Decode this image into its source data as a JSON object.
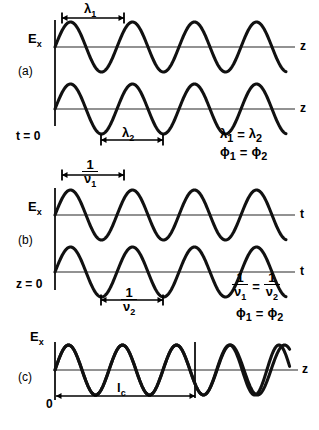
{
  "figure": {
    "background": "#ffffff",
    "ink": "#000000",
    "axis_color": "#6e6e6e",
    "wave_color": "#111111"
  },
  "panels": [
    {
      "id": "a",
      "label": "(a)",
      "label_pos": {
        "x": 18,
        "y": 71
      },
      "condition": "t = 0",
      "condition_pos": {
        "x": 16,
        "y": 136
      },
      "axis_variable": "z",
      "waves": [
        {
          "name": "wave-a1",
          "baseline_y": 47,
          "amplitude": 25,
          "wavelength_px": 62,
          "phase_deg": 0,
          "x_start": 55,
          "x_end": 286,
          "stroke": 3.1
        },
        {
          "name": "wave-a2",
          "baseline_y": 109,
          "amplitude": 25,
          "wavelength_px": 62,
          "phase_deg": 0,
          "x_start": 55,
          "x_end": 286,
          "stroke": 3.1
        }
      ],
      "axes": [
        {
          "name": "axis-a1",
          "y": 47,
          "x1": 55,
          "x2": 295,
          "end_label": "z",
          "end_label_pos": {
            "x": 300,
            "y": 42
          }
        },
        {
          "name": "axis-a2",
          "y": 109,
          "x1": 55,
          "x2": 295,
          "end_label": "z",
          "end_label_pos": {
            "x": 300,
            "y": 104
          }
        }
      ],
      "vertical_axis": {
        "x": 55,
        "y1": 20,
        "y2": 126
      },
      "y_labels": [
        {
          "text": "E",
          "sub": "x",
          "x": 28,
          "y": 38
        }
      ],
      "measures": [
        {
          "name": "lambda-1-measure",
          "symbol": "λ",
          "sub": "1",
          "x1": 62,
          "x2": 124,
          "y": 18,
          "label_x": 82,
          "label_y": 9,
          "ticks": true
        },
        {
          "name": "lambda-2-measure",
          "symbol": "λ",
          "sub": "2",
          "x1": 101,
          "x2": 163,
          "y": 140,
          "label_x": 120,
          "label_y": 131,
          "ticks": true
        }
      ],
      "annotations": [
        {
          "name": "annotation-lambda-equal",
          "text": "λ₁ = λ₂",
          "parts": [
            "λ",
            "1",
            " = ",
            "λ",
            "2"
          ],
          "x": 220,
          "y": 133
        },
        {
          "name": "annotation-phi-equal",
          "text": "φ₁ = φ₂",
          "parts": [
            "φ",
            "1",
            " = ",
            "φ",
            "2"
          ],
          "x": 220,
          "y": 151
        }
      ]
    },
    {
      "id": "b",
      "label": "(b)",
      "label_pos": {
        "x": 18,
        "y": 240
      },
      "condition": "z = 0",
      "condition_pos": {
        "x": 16,
        "y": 284
      },
      "axis_variable": "t",
      "waves": [
        {
          "name": "wave-b1",
          "baseline_y": 215,
          "amplitude": 25,
          "wavelength_px": 62,
          "phase_deg": 0,
          "x_start": 55,
          "x_end": 286,
          "stroke": 3.1
        },
        {
          "name": "wave-b2",
          "baseline_y": 272,
          "amplitude": 25,
          "wavelength_px": 62,
          "phase_deg": 0,
          "x_start": 55,
          "x_end": 286,
          "stroke": 3.1
        }
      ],
      "axes": [
        {
          "name": "axis-b1",
          "y": 215,
          "x1": 55,
          "x2": 295,
          "end_label": "t",
          "end_label_pos": {
            "x": 300,
            "y": 210
          }
        },
        {
          "name": "axis-b2",
          "y": 272,
          "x1": 55,
          "x2": 295,
          "end_label": "t",
          "end_label_pos": {
            "x": 300,
            "y": 267
          }
        }
      ],
      "vertical_axis": {
        "x": 55,
        "y1": 188,
        "y2": 290
      },
      "y_labels": [
        {
          "text": "E",
          "sub": "x",
          "x": 28,
          "y": 206
        }
      ],
      "measures": [
        {
          "name": "period-1-measure",
          "symbol": "1/ν",
          "sub": "1",
          "x1": 62,
          "x2": 124,
          "y": 175,
          "label_x": 83,
          "label_y": 162,
          "ticks": true
        },
        {
          "name": "period-2-measure",
          "symbol": "1/ν",
          "sub": "2",
          "x1": 101,
          "x2": 163,
          "y": 300,
          "label_x": 121,
          "label_y": 291,
          "ticks": true
        }
      ],
      "annotations": [
        {
          "name": "annotation-period-equal",
          "x": 232,
          "y": 277
        },
        {
          "name": "annotation-phi-equal-b",
          "text": "φ₁ = φ₂",
          "x": 236,
          "y": 311
        }
      ]
    },
    {
      "id": "c",
      "label": "(c)",
      "label_pos": {
        "x": 18,
        "y": 377
      },
      "condition": "",
      "axis_variable": "z",
      "waves": [
        {
          "name": "wave-c1",
          "baseline_y": 370,
          "amplitude": 25,
          "wavelength_px": 54,
          "phase_deg": 0,
          "x_start": 55,
          "x_end": 290,
          "stroke": 3.1
        },
        {
          "name": "wave-c2-dephasing",
          "baseline_y": 370,
          "amplitude": 25,
          "wavelength_px": 54,
          "phase_deg": 0,
          "x_start": 55,
          "x_end": 290,
          "stroke": 3.1,
          "dephase_start_x": 195,
          "dephase_total_deg": 48
        }
      ],
      "axes": [
        {
          "name": "axis-c1",
          "y": 370,
          "x1": 55,
          "x2": 298,
          "end_label": "z",
          "end_label_pos": {
            "x": 302,
            "y": 365
          }
        }
      ],
      "vertical_axis": {
        "x": 55,
        "y1": 342,
        "y2": 400
      },
      "marker_line": {
        "name": "coherence-length-marker",
        "x": 195,
        "y1": 342,
        "y2": 398
      },
      "y_labels": [
        {
          "text": "E",
          "sub": "x",
          "x": 30,
          "y": 336
        }
      ],
      "measures": [
        {
          "name": "coherence-length-measure",
          "symbol": "l",
          "sub": "c",
          "x1": 56,
          "x2": 195,
          "y": 396,
          "label_x": 117,
          "label_y": 386,
          "ticks": false
        }
      ],
      "origin_label": {
        "text": "0",
        "x": 46,
        "y": 402
      }
    }
  ],
  "symbols": {
    "lambda": "λ",
    "phi": "ϕ",
    "nu": "ν",
    "E": "E",
    "x": "x",
    "one": "1",
    "equals": "=",
    "z": "z",
    "t": "t",
    "l": "l",
    "c": "c",
    "zero": "0",
    "sub1": "1",
    "sub2": "2"
  },
  "texts": {
    "panel_a_label": "(a)",
    "panel_b_label": "(b)",
    "panel_c_label": "(c)",
    "t_equals_zero": "t = 0",
    "z_equals_zero": "z = 0",
    "axis_z": "z",
    "axis_t": "t",
    "origin_zero": "0"
  }
}
